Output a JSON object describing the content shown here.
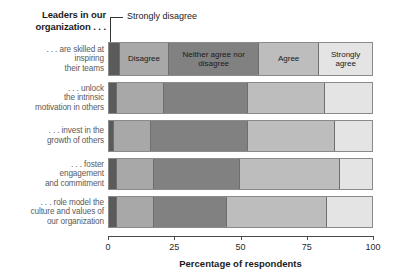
{
  "chart_data": {
    "type": "bar",
    "subtype": "stacked-horizontal-100",
    "title": "Leaders in our organization . . .",
    "xlabel": "Percentage of respondents",
    "ylabel": "",
    "xlim": [
      0,
      100
    ],
    "xticks": [
      0,
      25,
      50,
      75,
      100
    ],
    "xtick_labels": [
      "0",
      "25",
      "50",
      "75",
      "100"
    ],
    "grid": false,
    "legend_position": "in-bar-first-row",
    "annotations": [
      {
        "text": "Strongly disagree",
        "points_to": "leftmost segment of first bar"
      }
    ],
    "categories": [
      ". . . are skilled at inspiring their teams",
      ". . . unlock the intrinsic motivation in others",
      ". . . invest in the growth of others",
      ". . . foster engagement and commitment",
      ". . . role model the culture and values of our organization"
    ],
    "category_lines": [
      [
        ". . . are skilled at",
        "inspiring",
        "their teams"
      ],
      [
        ". . . unlock",
        "the intrinsic",
        "motivation in others"
      ],
      [
        ". . . invest in the",
        "growth of others"
      ],
      [
        ". . . foster",
        "engagement",
        "and commitment"
      ],
      [
        ". . . role model the",
        "culture and values of",
        "our organization"
      ]
    ],
    "series": [
      {
        "name": "Strongly disagree",
        "color": "#5b5b5b",
        "values": [
          4,
          3,
          2,
          3,
          3
        ]
      },
      {
        "name": "Disagree",
        "color": "#a8a8a8",
        "values": [
          19,
          18,
          14,
          14,
          14
        ]
      },
      {
        "name": "Neither agree nor disagree",
        "color": "#818181",
        "values": [
          34,
          32,
          37,
          33,
          28
        ]
      },
      {
        "name": "Agree",
        "color": "#bdbdbd",
        "values": [
          23,
          29,
          33,
          38,
          38
        ]
      },
      {
        "name": "Strongly agree",
        "color": "#e4e4e4",
        "values": [
          20,
          18,
          14,
          12,
          17
        ]
      }
    ],
    "inbar_labels": [
      "",
      "Disagree",
      "Neither agree nor disagree",
      "Agree",
      "Strongly agree"
    ]
  }
}
